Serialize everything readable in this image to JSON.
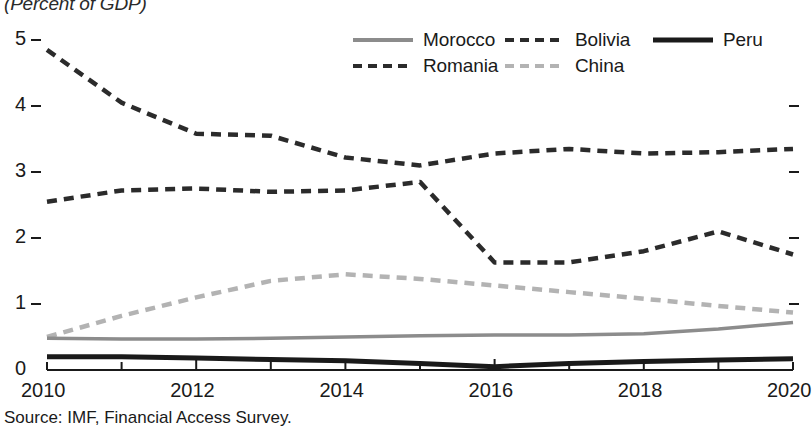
{
  "title": "(Percent of GDP)",
  "source": "Source: IMF, Financial Access Survey.",
  "legend": {
    "items": [
      {
        "label": "Morocco",
        "style": "solid",
        "color": "#8c8c8c",
        "width": 4
      },
      {
        "label": "Bolivia",
        "style": "dashed",
        "color": "#2b2b2b",
        "width": 4
      },
      {
        "label": "Peru",
        "style": "solid",
        "color": "#1a1a1a",
        "width": 5
      },
      {
        "label": "Romania",
        "style": "dashed",
        "color": "#2b2b2b",
        "width": 4
      },
      {
        "label": "China",
        "style": "dashed",
        "color": "#b3b3b3",
        "width": 4
      }
    ]
  },
  "axes": {
    "y_ticks": [
      "0",
      "1",
      "2",
      "3",
      "4",
      "5"
    ],
    "y_ticks_right": [
      "1",
      "2",
      "3",
      "4"
    ],
    "x_labels": [
      "2010",
      "2012",
      "2014",
      "2016",
      "2018",
      "2020"
    ]
  },
  "chart_data": {
    "type": "line",
    "title": "(Percent of GDP)",
    "xlabel": "",
    "ylabel": "",
    "xlim": [
      2010,
      2020
    ],
    "ylim": [
      0,
      5
    ],
    "grid": false,
    "legend_position": "top-right",
    "x": [
      2010,
      2011,
      2012,
      2013,
      2014,
      2015,
      2016,
      2017,
      2018,
      2019,
      2020
    ],
    "series": [
      {
        "name": "Romania",
        "color": "#2b2b2b",
        "style": "dashed",
        "values": [
          4.85,
          4.05,
          3.58,
          3.55,
          3.22,
          3.1,
          3.28,
          3.35,
          3.28,
          3.3,
          3.35
        ]
      },
      {
        "name": "Bolivia",
        "color": "#2b2b2b",
        "style": "dashed",
        "values": [
          2.55,
          2.72,
          2.75,
          2.7,
          2.72,
          2.85,
          1.63,
          1.63,
          1.8,
          2.1,
          1.75
        ]
      },
      {
        "name": "China",
        "color": "#b3b3b3",
        "style": "dashed",
        "values": [
          0.5,
          0.82,
          1.1,
          1.35,
          1.45,
          1.38,
          1.28,
          1.18,
          1.08,
          0.97,
          0.87
        ]
      },
      {
        "name": "Morocco",
        "color": "#8c8c8c",
        "style": "solid",
        "values": [
          0.48,
          0.47,
          0.47,
          0.48,
          0.5,
          0.52,
          0.53,
          0.53,
          0.55,
          0.62,
          0.72
        ]
      },
      {
        "name": "Peru",
        "color": "#1a1a1a",
        "style": "solid",
        "values": [
          0.2,
          0.2,
          0.18,
          0.16,
          0.14,
          0.1,
          0.05,
          0.1,
          0.13,
          0.15,
          0.17
        ]
      }
    ]
  }
}
